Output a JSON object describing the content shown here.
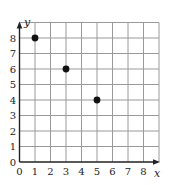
{
  "chart_data": {
    "type": "scatter",
    "title": "",
    "xlabel": "x",
    "ylabel": "y",
    "xlim": [
      0,
      9
    ],
    "ylim": [
      0,
      9
    ],
    "x_ticks": [
      "0",
      "1",
      "2",
      "3",
      "4",
      "5",
      "6",
      "7",
      "8"
    ],
    "y_ticks": [
      "0",
      "1",
      "2",
      "3",
      "4",
      "5",
      "6",
      "7",
      "8"
    ],
    "grid": true,
    "legend": null,
    "points": [
      {
        "x": 1,
        "y": 8
      },
      {
        "x": 3,
        "y": 6
      },
      {
        "x": 5,
        "y": 4
      }
    ],
    "colors": {
      "grid": "#9a9a9a",
      "axis": "#222222",
      "point": "#111111"
    }
  }
}
